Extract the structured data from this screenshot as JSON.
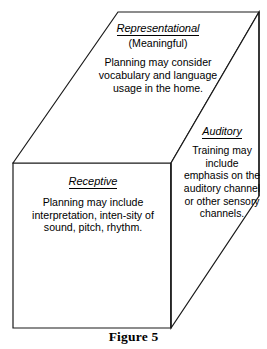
{
  "figure": {
    "caption": "Figure 5",
    "line_color": "#1a1a1a",
    "background_color": "#ffffff"
  },
  "faces": {
    "top": {
      "name": "Representational",
      "heading": "Representational",
      "subheading": "(Meaningful)",
      "body": "Planning may consider vocabulary and language usage in the home."
    },
    "right": {
      "name": "Auditory",
      "heading": "Auditory",
      "body": "Training may include emphasis on the auditory channel or other sensory channels."
    },
    "front": {
      "name": "Receptive",
      "heading": "Receptive",
      "body": "Planning may include interpretation, inten-sity of sound, pitch, rhythm."
    }
  }
}
